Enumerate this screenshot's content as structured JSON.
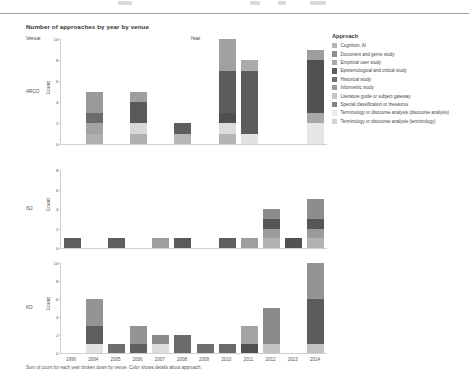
{
  "chart_data": {
    "type": "bar",
    "title": "Number of approaches by year by venue",
    "caption": "Sum of count for each year broken down by venue. Color shows details about approach.",
    "xlabel": "Year",
    "ylabel": "Count",
    "venue_header": "Venue",
    "legend_title": "Approach",
    "grid": false,
    "legend_position": "right",
    "stacked": true,
    "categories": [
      "1996",
      "2004",
      "2005",
      "2006",
      "2007",
      "2008",
      "2009",
      "2010",
      "2011",
      "2012",
      "2013",
      "2014"
    ],
    "series": [
      {
        "name": "Cognition, AI",
        "color": "#b4b4b4"
      },
      {
        "name": "Document and genre study",
        "color": "#8f8f8f"
      },
      {
        "name": "Empirical user study",
        "color": "#a8a8a8"
      },
      {
        "name": "Epistemological and critical study",
        "color": "#5e5e5e"
      },
      {
        "name": "Historical study",
        "color": "#6e6e6e"
      },
      {
        "name": "Informetric study",
        "color": "#9c9c9c"
      },
      {
        "name": "Literature guide or subject gateway",
        "color": "#c6c6c6"
      },
      {
        "name": "Special classification or thesaurus",
        "color": "#848484"
      },
      {
        "name": "Terminology or discourse analysis (discourse analysis)",
        "color": "#ebebeb"
      },
      {
        "name": "Terminology or discourse analysis (terminology)",
        "color": "#d2d2d2"
      }
    ],
    "panels": [
      {
        "venue": "ARCO",
        "ylim": [
          0,
          10
        ],
        "yticks": [
          0,
          2,
          4,
          6,
          8,
          10
        ],
        "bars": [
          {
            "year": "1996",
            "total": 0,
            "segments": []
          },
          {
            "year": "2004",
            "total": 5,
            "segments": [
              {
                "series": "Terminology or discourse analysis (terminology)",
                "value": 1,
                "color": "#b0b0b0"
              },
              {
                "series": "Literature guide or subject gateway",
                "value": 1,
                "color": "#a2a2a2"
              },
              {
                "series": "Epistemological and critical study",
                "value": 1,
                "color": "#6b6b6b"
              },
              {
                "series": "Cognition, AI",
                "value": 2,
                "color": "#9a9a9a"
              }
            ]
          },
          {
            "year": "2005",
            "total": 0,
            "segments": []
          },
          {
            "year": "2006",
            "total": 5,
            "segments": [
              {
                "series": "Terminology or discourse analysis (terminology)",
                "value": 1,
                "color": "#b0b0b0"
              },
              {
                "series": "Terminology or discourse analysis (discourse analysis)",
                "value": 1,
                "color": "#d8d8d8"
              },
              {
                "series": "Epistemological and critical study",
                "value": 2,
                "color": "#5a5a5a"
              },
              {
                "series": "Cognition, AI",
                "value": 1,
                "color": "#9e9e9e"
              }
            ]
          },
          {
            "year": "2007",
            "total": 0,
            "segments": []
          },
          {
            "year": "2008",
            "total": 2,
            "segments": [
              {
                "series": "Terminology or discourse analysis (terminology)",
                "value": 1,
                "color": "#b6b6b6"
              },
              {
                "series": "Epistemological and critical study",
                "value": 1,
                "color": "#5e5e5e"
              }
            ]
          },
          {
            "year": "2009",
            "total": 0,
            "segments": []
          },
          {
            "year": "2010",
            "total": 10,
            "segments": [
              {
                "series": "Terminology or discourse analysis (terminology)",
                "value": 1,
                "color": "#b4b4b4"
              },
              {
                "series": "Terminology or discourse analysis (discourse analysis)",
                "value": 1,
                "color": "#dcdcdc"
              },
              {
                "series": "Special classification or thesaurus",
                "value": 1,
                "color": "#4f4f4f"
              },
              {
                "series": "Epistemological and critical study",
                "value": 4,
                "color": "#5c5c5c"
              },
              {
                "series": "Cognition, AI",
                "value": 3,
                "color": "#a0a0a0"
              }
            ]
          },
          {
            "year": "2011",
            "total": 8,
            "segments": [
              {
                "series": "Terminology or discourse analysis (discourse analysis)",
                "value": 1,
                "color": "#e2e2e2"
              },
              {
                "series": "Epistemological and critical study",
                "value": 6,
                "color": "#5c5c5c"
              },
              {
                "series": "Cognition, AI",
                "value": 1,
                "color": "#ababab"
              }
            ]
          },
          {
            "year": "2012",
            "total": 0,
            "segments": []
          },
          {
            "year": "2013",
            "total": 0,
            "segments": []
          },
          {
            "year": "2014",
            "total": 9,
            "segments": [
              {
                "series": "Terminology or discourse analysis (discourse analysis)",
                "value": 2,
                "color": "#e6e6e6"
              },
              {
                "series": "Literature guide or subject gateway",
                "value": 1,
                "color": "#a8a8a8"
              },
              {
                "series": "Epistemological and critical study",
                "value": 5,
                "color": "#515151"
              },
              {
                "series": "Cognition, AI",
                "value": 1,
                "color": "#9e9e9e"
              }
            ]
          }
        ]
      },
      {
        "venue": "ISJ",
        "ylim": [
          0,
          8
        ],
        "yticks": [
          0,
          2,
          4,
          6,
          8
        ],
        "bars": [
          {
            "year": "1996",
            "total": 1,
            "segments": [
              {
                "series": "Epistemological and critical study",
                "value": 1,
                "color": "#5e5e5e"
              }
            ]
          },
          {
            "year": "2004",
            "total": 0,
            "segments": []
          },
          {
            "year": "2005",
            "total": 1,
            "segments": [
              {
                "series": "Epistemological and critical study",
                "value": 1,
                "color": "#5e5e5e"
              }
            ]
          },
          {
            "year": "2006",
            "total": 0,
            "segments": []
          },
          {
            "year": "2007",
            "total": 1,
            "segments": [
              {
                "series": "Cognition, AI",
                "value": 1,
                "color": "#9e9e9e"
              }
            ]
          },
          {
            "year": "2008",
            "total": 1,
            "segments": [
              {
                "series": "Epistemological and critical study",
                "value": 1,
                "color": "#595959"
              }
            ]
          },
          {
            "year": "2009",
            "total": 0,
            "segments": []
          },
          {
            "year": "2010",
            "total": 1,
            "segments": [
              {
                "series": "Epistemological and critical study",
                "value": 1,
                "color": "#5e5e5e"
              }
            ]
          },
          {
            "year": "2011",
            "total": 1,
            "segments": [
              {
                "series": "Cognition, AI",
                "value": 1,
                "color": "#9e9e9e"
              }
            ]
          },
          {
            "year": "2012",
            "total": 4,
            "segments": [
              {
                "series": "Terminology or discourse analysis (terminology)",
                "value": 1,
                "color": "#b2b2b2"
              },
              {
                "series": "Informetric study",
                "value": 1,
                "color": "#9c9c9c"
              },
              {
                "series": "Epistemological and critical study",
                "value": 1,
                "color": "#565656"
              },
              {
                "series": "Cognition, AI",
                "value": 1,
                "color": "#8d8d8d"
              }
            ]
          },
          {
            "year": "2013",
            "total": 1,
            "segments": [
              {
                "series": "Epistemological and critical study",
                "value": 1,
                "color": "#515151"
              }
            ]
          },
          {
            "year": "2014",
            "total": 5,
            "segments": [
              {
                "series": "Terminology or discourse analysis (terminology)",
                "value": 1,
                "color": "#b2b2b2"
              },
              {
                "series": "Informetric study",
                "value": 1,
                "color": "#9a9a9a"
              },
              {
                "series": "Epistemological and critical study",
                "value": 1,
                "color": "#565656"
              },
              {
                "series": "Cognition, AI",
                "value": 2,
                "color": "#8d8d8d"
              }
            ]
          }
        ]
      },
      {
        "venue": "KO",
        "ylim": [
          0,
          10
        ],
        "yticks": [
          0,
          2,
          4,
          6,
          8,
          10
        ],
        "bars": [
          {
            "year": "1996",
            "total": 0,
            "segments": []
          },
          {
            "year": "2004",
            "total": 6,
            "segments": [
              {
                "series": "Terminology or discourse analysis (discourse analysis)",
                "value": 1,
                "color": "#e2e2e2"
              },
              {
                "series": "Epistemological and critical study",
                "value": 2,
                "color": "#5e5e5e"
              },
              {
                "series": "Cognition, AI",
                "value": 3,
                "color": "#949494"
              }
            ]
          },
          {
            "year": "2005",
            "total": 1,
            "segments": [
              {
                "series": "Epistemological and critical study",
                "value": 1,
                "color": "#6e6e6e"
              }
            ]
          },
          {
            "year": "2006",
            "total": 3,
            "segments": [
              {
                "series": "Epistemological and critical study",
                "value": 1,
                "color": "#606060"
              },
              {
                "series": "Cognition, AI",
                "value": 2,
                "color": "#949494"
              }
            ]
          },
          {
            "year": "2007",
            "total": 2,
            "segments": [
              {
                "series": "Terminology or discourse analysis (discourse analysis)",
                "value": 1,
                "color": "#dcdcdc"
              },
              {
                "series": "Cognition, AI",
                "value": 1,
                "color": "#8a8a8a"
              }
            ]
          },
          {
            "year": "2008",
            "total": 2,
            "segments": [
              {
                "series": "Epistemological and critical study",
                "value": 2,
                "color": "#6a6a6a"
              }
            ]
          },
          {
            "year": "2009",
            "total": 1,
            "segments": [
              {
                "series": "Epistemological and critical study",
                "value": 1,
                "color": "#6e6e6e"
              }
            ]
          },
          {
            "year": "2010",
            "total": 1,
            "segments": [
              {
                "series": "Epistemological and critical study",
                "value": 1,
                "color": "#6a6a6a"
              }
            ]
          },
          {
            "year": "2011",
            "total": 3,
            "segments": [
              {
                "series": "Epistemological and critical study",
                "value": 1,
                "color": "#505050"
              },
              {
                "series": "Cognition, AI",
                "value": 2,
                "color": "#a4a4a4"
              }
            ]
          },
          {
            "year": "2012",
            "total": 5,
            "segments": [
              {
                "series": "Terminology or discourse analysis (terminology)",
                "value": 1,
                "color": "#c2c2c2"
              },
              {
                "series": "Cognition, AI",
                "value": 4,
                "color": "#8a8a8a"
              }
            ]
          },
          {
            "year": "2013",
            "total": 0,
            "segments": []
          },
          {
            "year": "2014",
            "total": 10,
            "segments": [
              {
                "series": "Terminology or discourse analysis (terminology)",
                "value": 1,
                "color": "#c2c2c2"
              },
              {
                "series": "Epistemological and critical study",
                "value": 5,
                "color": "#5c5c5c"
              },
              {
                "series": "Cognition, AI",
                "value": 4,
                "color": "#949494"
              }
            ]
          }
        ]
      }
    ]
  }
}
